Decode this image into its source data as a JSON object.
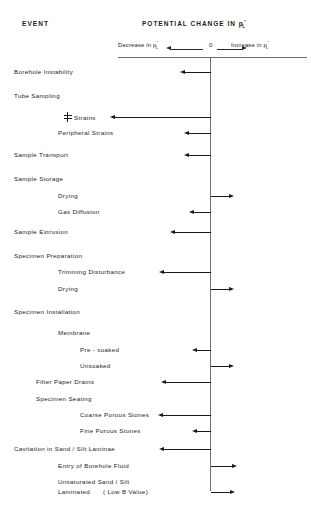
{
  "header": {
    "event_col_title": "EVENT",
    "chart_title_prefix": "POTENTIAL CHANGE IN ",
    "symbol": {
      "base": "p",
      "subscript": "L",
      "prime": "'"
    },
    "axis": {
      "decrease_label": "Decrease in ",
      "zero_label": "0",
      "increase_label": "Increase in ",
      "left_arrow_icon": "arrow-left-icon",
      "right_arrow_icon": "arrow-right-icon"
    }
  },
  "chart_data": {
    "type": "bar",
    "xlabel": "Potential change in p'L (Decrease <- 0 -> Increase)",
    "ylabel": "Event",
    "orientation": "horizontal",
    "axis_origin_label": "0",
    "xlim": [
      -100,
      100
    ],
    "grid": false,
    "legend": null,
    "note": "Qualitative diagram: bar lengths indicate relative magnitude of potential change in mean effective stress p'L for each sample-disturbance event.",
    "categories": [
      "Borehole Instability",
      "Tube Sampling",
      "℄ Strains",
      "Peripheral Strains",
      "Sample Transport",
      "Sample Storage",
      "Drying",
      "Gas Diffusion",
      "Sample Extrusion",
      "Specimen Preparation",
      "Trimming Disturbance",
      "Drying",
      "Specimen Installation",
      "Membrane",
      "Pre - soaked",
      "Unsoaked",
      "Filter Paper Drains",
      "Specimen  Seating",
      "Coarse Porous Stones",
      "Fine Porous Stones",
      "Cavitation in Sand / Silt Laminae",
      "Entry of Borehole Fluid",
      "Unsaturated Sand / Silt Laminated ( Low B Value)"
    ],
    "values": [
      -26,
      null,
      -96,
      -22,
      -22,
      null,
      19,
      -17,
      -36,
      null,
      -47,
      19,
      null,
      null,
      -14,
      19,
      -45,
      null,
      -48,
      -14,
      -47,
      22,
      20
    ]
  },
  "rows": [
    {
      "label": "Borehole Instability",
      "indent": 0,
      "y": 72,
      "arrow": {
        "dir": "left",
        "len": 26
      }
    },
    {
      "label": "Tube Sampling",
      "indent": 0,
      "y": 96,
      "arrow": null
    },
    {
      "label": "Strains",
      "indent": "cl",
      "y": 117,
      "arrow": {
        "dir": "left",
        "len": 96
      },
      "icon": "centerline-icon"
    },
    {
      "label": "Peripheral Strains",
      "indent": 2,
      "y": 133,
      "arrow": {
        "dir": "left",
        "len": 22
      }
    },
    {
      "label": "Sample Transport",
      "indent": 0,
      "y": 155,
      "arrow": {
        "dir": "left",
        "len": 22
      }
    },
    {
      "label": "Sample Storage",
      "indent": 0,
      "y": 179,
      "arrow": null
    },
    {
      "label": "Drying",
      "indent": 2,
      "y": 196,
      "arrow": {
        "dir": "right",
        "len": 19
      }
    },
    {
      "label": "Gas Diffusion",
      "indent": 2,
      "y": 212,
      "arrow": {
        "dir": "left",
        "len": 17
      }
    },
    {
      "label": "Sample  Extrusion",
      "indent": 0,
      "y": 232,
      "arrow": {
        "dir": "left",
        "len": 36
      }
    },
    {
      "label": "Specimen Preparation",
      "indent": 0,
      "y": 256,
      "arrow": null
    },
    {
      "label": "Trimming Disturbance",
      "indent": 2,
      "y": 272,
      "arrow": {
        "dir": "left",
        "len": 47
      }
    },
    {
      "label": "Drying",
      "indent": 2,
      "y": 289,
      "arrow": {
        "dir": "right",
        "len": 19
      }
    },
    {
      "label": "Specimen Installation",
      "indent": 0,
      "y": 312,
      "arrow": null
    },
    {
      "label": "Membrane",
      "indent": 2,
      "y": 333,
      "arrow": null
    },
    {
      "label": "Pre - soaked",
      "indent": 3,
      "y": 350,
      "arrow": {
        "dir": "left",
        "len": 14
      }
    },
    {
      "label": "Unsoaked",
      "indent": 3,
      "y": 366,
      "arrow": {
        "dir": "right",
        "len": 19
      }
    },
    {
      "label": "Filter Paper Drains",
      "indent": 1,
      "y": 382,
      "arrow": {
        "dir": "left",
        "len": 45
      }
    },
    {
      "label": "Specimen  Seating",
      "indent": 1,
      "y": 399,
      "arrow": null
    },
    {
      "label": "Coarse Porous Stones",
      "indent": 3,
      "y": 415,
      "arrow": {
        "dir": "left",
        "len": 48
      }
    },
    {
      "label": "Fine Porous Stones",
      "indent": 3,
      "y": 431,
      "arrow": {
        "dir": "left",
        "len": 14
      }
    },
    {
      "label": "Cavitation in Sand / Silt Laminae",
      "indent": 0,
      "y": 449,
      "arrow": {
        "dir": "left",
        "len": 47
      }
    },
    {
      "label": "Entry of Borehole Fluid",
      "indent": 2,
      "y": 466,
      "arrow": {
        "dir": "right",
        "len": 22
      }
    },
    {
      "label": "Unsaturated Sand / Silt",
      "indent": 2,
      "y": 482,
      "arrow": null
    },
    {
      "label": "Laminated",
      "indent": 2,
      "y": 492,
      "arrow": {
        "dir": "right",
        "len": 20
      },
      "suffix": "( Low B Value)"
    }
  ]
}
